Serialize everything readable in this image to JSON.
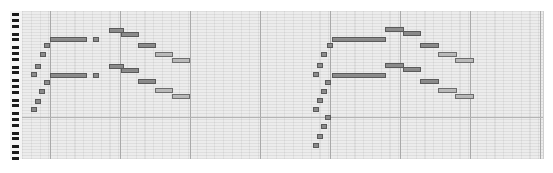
{
  "app": {
    "view": "piano-roll"
  },
  "colors": {
    "grid_bg": "#ececec",
    "note_fill": "#8a8a8a",
    "note_border": "#5a5a5a",
    "bar_line": "#a9a9a9",
    "black_key": "#1a1a1a"
  },
  "piano_keys": {
    "black_key_y": [
      13,
      19,
      25,
      33,
      38,
      46,
      52,
      58,
      66,
      71,
      79,
      85,
      91,
      99,
      104,
      112,
      118,
      124,
      132,
      137,
      145,
      151,
      157
    ]
  },
  "grid": {
    "bar_lines_x": [
      50,
      120,
      190,
      260,
      330,
      400,
      470,
      540
    ],
    "octave_lines_y": [
      117
    ]
  },
  "notes": [
    {
      "x": 31,
      "y": 107,
      "w": 4
    },
    {
      "x": 35,
      "y": 99,
      "w": 4
    },
    {
      "x": 39,
      "y": 89,
      "w": 4
    },
    {
      "x": 44,
      "y": 80,
      "w": 4
    },
    {
      "x": 31,
      "y": 72,
      "w": 4
    },
    {
      "x": 35,
      "y": 64,
      "w": 4
    },
    {
      "x": 40,
      "y": 52,
      "w": 4
    },
    {
      "x": 44,
      "y": 43,
      "w": 4
    },
    {
      "x": 50,
      "y": 37,
      "w": 35
    },
    {
      "x": 50,
      "y": 73,
      "w": 35
    },
    {
      "x": 93,
      "y": 37,
      "w": 4
    },
    {
      "x": 93,
      "y": 73,
      "w": 4
    },
    {
      "x": 109,
      "y": 28,
      "w": 13
    },
    {
      "x": 121,
      "y": 32,
      "w": 16
    },
    {
      "x": 138,
      "y": 43,
      "w": 16
    },
    {
      "x": 155,
      "y": 52,
      "w": 16,
      "light": true
    },
    {
      "x": 172,
      "y": 58,
      "w": 16,
      "light": true
    },
    {
      "x": 109,
      "y": 64,
      "w": 13
    },
    {
      "x": 121,
      "y": 68,
      "w": 16
    },
    {
      "x": 138,
      "y": 79,
      "w": 16
    },
    {
      "x": 155,
      "y": 88,
      "w": 16,
      "light": true
    },
    {
      "x": 172,
      "y": 94,
      "w": 16,
      "light": true
    },
    {
      "x": 313,
      "y": 143,
      "w": 4
    },
    {
      "x": 317,
      "y": 134,
      "w": 4
    },
    {
      "x": 321,
      "y": 124,
      "w": 4
    },
    {
      "x": 325,
      "y": 115,
      "w": 4
    },
    {
      "x": 313,
      "y": 107,
      "w": 4
    },
    {
      "x": 317,
      "y": 98,
      "w": 4
    },
    {
      "x": 321,
      "y": 89,
      "w": 4
    },
    {
      "x": 325,
      "y": 80,
      "w": 4
    },
    {
      "x": 313,
      "y": 72,
      "w": 4
    },
    {
      "x": 317,
      "y": 63,
      "w": 4
    },
    {
      "x": 321,
      "y": 52,
      "w": 4
    },
    {
      "x": 327,
      "y": 43,
      "w": 4
    },
    {
      "x": 332,
      "y": 37,
      "w": 52
    },
    {
      "x": 332,
      "y": 73,
      "w": 52
    },
    {
      "x": 385,
      "y": 27,
      "w": 17
    },
    {
      "x": 403,
      "y": 31,
      "w": 16
    },
    {
      "x": 420,
      "y": 43,
      "w": 17
    },
    {
      "x": 438,
      "y": 52,
      "w": 17,
      "light": true
    },
    {
      "x": 455,
      "y": 58,
      "w": 17,
      "light": true
    },
    {
      "x": 385,
      "y": 63,
      "w": 17
    },
    {
      "x": 403,
      "y": 67,
      "w": 16
    },
    {
      "x": 420,
      "y": 79,
      "w": 17
    },
    {
      "x": 438,
      "y": 88,
      "w": 17,
      "light": true
    },
    {
      "x": 455,
      "y": 94,
      "w": 17,
      "light": true
    }
  ]
}
